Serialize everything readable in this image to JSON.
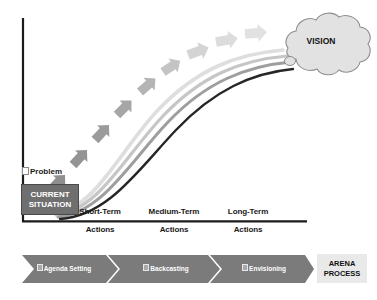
{
  "diagram": {
    "colors": {
      "axis": "#1b1b1b",
      "current_situation_fill": "#6f6f6f",
      "current_situation_text": "#ffffff",
      "cloud_fill": "#e2e2e2",
      "cloud_stroke": "#8c8c8c",
      "chevron_fill": "#7b7b7b",
      "arena_box_fill": "#e9e9e9",
      "path_dark": "#262626",
      "path_mid": "#9e9e9e",
      "path_light": "#c6c6c6",
      "path_lightest": "#dedede",
      "arrow_dark": "#8a8a8a",
      "arrow_light": "#e0e0e0"
    },
    "start_node": {
      "label": "CURRENT\nSITUATION",
      "line1": "CURRENT",
      "line2": "SITUATION"
    },
    "end_node": {
      "label": "VISION",
      "shape": "cloud"
    },
    "annotation": {
      "glyph": "box-glyph",
      "line1": "Problem",
      "line2": "Structuring",
      "text": "Problem Structuring"
    },
    "axis_labels": [
      {
        "id": "short",
        "line1": "Short-Term",
        "line2": "Actions",
        "text": "Short-Term Actions"
      },
      {
        "id": "medium",
        "line1": "Medium-Term",
        "line2": "Actions",
        "text": "Medium-Term Actions"
      },
      {
        "id": "long",
        "line1": "Long-Term",
        "line2": "Actions",
        "text": "Long-Term Actions"
      }
    ],
    "paths": [
      {
        "id": "path-dark",
        "shade": "dark",
        "color": "#262626"
      },
      {
        "id": "path-mid",
        "shade": "mid",
        "color": "#9e9e9e"
      },
      {
        "id": "path-light",
        "shade": "light",
        "color": "#c6c6c6"
      },
      {
        "id": "path-lightest",
        "shade": "lightest",
        "color": "#dedede"
      }
    ],
    "arrow_chain": {
      "count": 9,
      "description": "chain of chevron arrows rising from current situation toward vision, fading from dark grey to light grey"
    },
    "arena_band": {
      "process_label": "ARENA\nPROCESS",
      "process_line1": "ARENA",
      "process_line2": "PROCESS",
      "stages": [
        {
          "id": "agenda-setting",
          "label": "Agenda Setting"
        },
        {
          "id": "backcasting",
          "label": "Backcasting"
        },
        {
          "id": "envisioning",
          "label": "Envisioning"
        }
      ]
    }
  }
}
